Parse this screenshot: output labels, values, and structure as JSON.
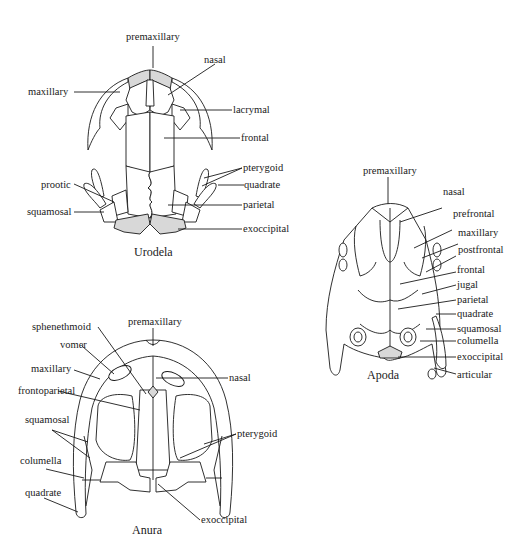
{
  "figure": {
    "panels": [
      {
        "caption": "Urodela",
        "labels": {
          "premaxillary": "premaxillary",
          "nasal": "nasal",
          "maxillary": "maxillary",
          "lacrymal": "lacrymal",
          "frontal": "frontal",
          "pterygoid": "pterygoid",
          "prootic": "prootic",
          "quadrate": "quadrate",
          "squamosal": "squamosal",
          "parietal": "parietal",
          "exoccipital": "exoccipital"
        }
      },
      {
        "caption": "Apoda",
        "labels": {
          "premaxillary": "premaxillary",
          "nasal": "nasal",
          "prefrontal": "prefrontal",
          "maxillary": "maxillary",
          "postfrontal": "postfrontal",
          "frontal": "frontal",
          "jugal": "jugal",
          "parietal": "parietal",
          "quadrate": "quadrate",
          "squamosal": "squamosal",
          "columella": "columella",
          "exoccipital": "exoccipital",
          "articular": "articular"
        }
      },
      {
        "caption": "Anura",
        "labels": {
          "premaxillary": "premaxillary",
          "sphenethmoid": "sphenethmoid",
          "vomer": "vomer",
          "maxillary": "maxillary",
          "nasal": "nasal",
          "frontoparietal": "frontoparietal",
          "squamosal": "squamosal",
          "pterygoid": "pterygoid",
          "columella": "columella",
          "quadrate": "quadrate",
          "exoccipital": "exoccipital"
        }
      }
    ]
  }
}
